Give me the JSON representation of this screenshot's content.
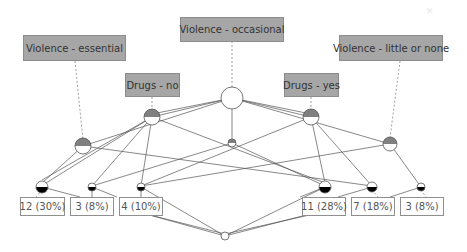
{
  "diagram": {
    "type": "concept-lattice",
    "attributes": [
      {
        "id": "a1",
        "label": "Violence - essential"
      },
      {
        "id": "a2",
        "label": "Drugs - no"
      },
      {
        "id": "a3",
        "label": "Violence - occasional"
      },
      {
        "id": "a4",
        "label": "Drugs - yes"
      },
      {
        "id": "a5",
        "label": "Violence - little or none"
      }
    ],
    "objects": [
      {
        "id": "o1",
        "label": "12 (30%)"
      },
      {
        "id": "o2",
        "label": "3 (8%)"
      },
      {
        "id": "o3",
        "label": "4 (10%)"
      },
      {
        "id": "o4",
        "label": "11 (28%)"
      },
      {
        "id": "o5",
        "label": "7 (18%)"
      },
      {
        "id": "o6",
        "label": "3 (8%)"
      }
    ],
    "corner_icon": "close-icon",
    "colors": {
      "attribute_fill": "#a6a6a6",
      "node_top_half": "#808080",
      "node_bottom_half": "#000000"
    }
  }
}
